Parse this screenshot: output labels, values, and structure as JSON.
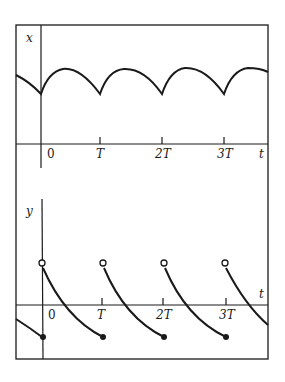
{
  "figure": {
    "upper_plot": {
      "y_label": "x",
      "x_label": "t",
      "ticks": [
        "0",
        "T",
        "2T",
        "3T"
      ]
    },
    "lower_plot": {
      "y_label": "y",
      "x_label": "t",
      "ticks": [
        "0",
        "T",
        "2T",
        "3T"
      ]
    }
  },
  "colors": {
    "ink": "#1a1a1a",
    "background": "#ffffff"
  }
}
